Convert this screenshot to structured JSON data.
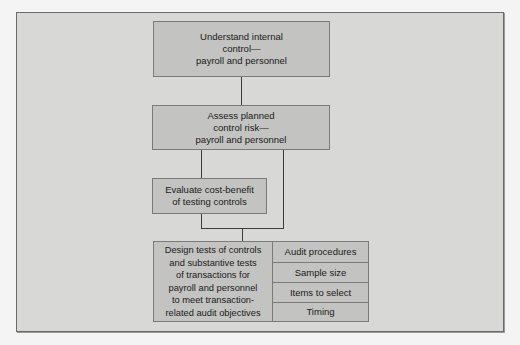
{
  "diagram": {
    "type": "flowchart",
    "nodes": [
      {
        "id": "understand",
        "label": "Understand internal\ncontrol—\npayroll and personnel"
      },
      {
        "id": "assess",
        "label": "Assess planned\ncontrol risk—\npayroll and personnel"
      },
      {
        "id": "evaluate",
        "label": "Evaluate cost-benefit\nof testing controls"
      },
      {
        "id": "design",
        "label": "Design tests of controls\nand substantive tests\nof transactions for\npayroll and personnel\nto meet transaction-\nrelated audit objectives"
      }
    ],
    "design_components": [
      {
        "label": "Audit procedures"
      },
      {
        "label": "Sample size"
      },
      {
        "label": "Items to select"
      },
      {
        "label": "Timing"
      }
    ],
    "edges": [
      {
        "from": "understand",
        "to": "assess"
      },
      {
        "from": "assess",
        "to": "evaluate"
      },
      {
        "from": "evaluate",
        "to": "design"
      },
      {
        "from": "assess",
        "to": "design"
      }
    ],
    "colors": {
      "page": "#f4f4f4",
      "frame": "#d8d8d6",
      "box": "#c3c3c1",
      "line": "#3c3c3c"
    }
  }
}
